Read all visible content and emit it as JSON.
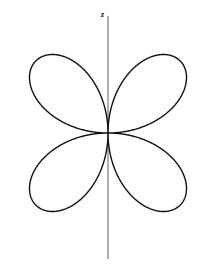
{
  "figure": {
    "name": "four-lobe-polar-pattern",
    "width": 216,
    "height": 267,
    "background_color": "#ffffff"
  },
  "axes": {
    "vertical": {
      "label": "z",
      "label_style": "bold-italic",
      "color": "#6e6e6e",
      "stroke_width": 1.1,
      "x": 108,
      "y_top": 16,
      "y_bottom": 259
    }
  },
  "curve": {
    "name": "four-lobe-rose",
    "color": "#111111",
    "stroke_width": 1.4,
    "fill": "none",
    "origin": {
      "x": 108,
      "y": 133
    },
    "lobe_count": 4,
    "lobe_axis_angles_deg": [
      45,
      135,
      225,
      315
    ],
    "lobe_half_width_deg": 45,
    "lobe_radius_px": 102,
    "lobe_tips_px": [
      {
        "label": "upper-left",
        "x": 22,
        "y": 48
      },
      {
        "label": "upper-right",
        "x": 194,
        "y": 48
      },
      {
        "label": "lower-left",
        "x": 22,
        "y": 218
      },
      {
        "label": "lower-right",
        "x": 194,
        "y": 218
      }
    ]
  },
  "chart_data": {
    "type": "line",
    "plot_style": "polar",
    "title": "",
    "subtitle": "",
    "xlabel": "",
    "ylabel": "z",
    "legend": [],
    "grid": false,
    "annotations": [
      {
        "text": "z",
        "x_px": 105,
        "y_px": 15,
        "role": "axis-label"
      }
    ],
    "theta_deg": [
      0,
      5,
      10,
      15,
      20,
      25,
      30,
      35,
      40,
      45,
      50,
      55,
      60,
      65,
      70,
      75,
      80,
      85,
      90,
      95,
      100,
      105,
      110,
      115,
      120,
      125,
      130,
      135,
      140,
      145,
      150,
      155,
      160,
      165,
      170,
      175,
      180,
      185,
      190,
      195,
      200,
      205,
      210,
      215,
      220,
      225,
      230,
      235,
      240,
      245,
      250,
      255,
      260,
      265,
      270,
      275,
      280,
      285,
      290,
      295,
      300,
      305,
      310,
      315,
      320,
      325,
      330,
      335,
      340,
      345,
      350,
      355,
      360
    ],
    "r_normalized": [
      0.0,
      0.174,
      0.342,
      0.5,
      0.643,
      0.766,
      0.866,
      0.94,
      0.985,
      1.0,
      0.985,
      0.94,
      0.866,
      0.766,
      0.643,
      0.5,
      0.342,
      0.174,
      0.0,
      0.174,
      0.342,
      0.5,
      0.643,
      0.766,
      0.866,
      0.94,
      0.985,
      1.0,
      0.985,
      0.94,
      0.866,
      0.766,
      0.643,
      0.5,
      0.342,
      0.174,
      0.0,
      0.174,
      0.342,
      0.5,
      0.643,
      0.766,
      0.866,
      0.94,
      0.985,
      1.0,
      0.985,
      0.94,
      0.866,
      0.766,
      0.643,
      0.5,
      0.342,
      0.174,
      0.0,
      0.174,
      0.342,
      0.5,
      0.643,
      0.766,
      0.866,
      0.94,
      0.985,
      1.0,
      0.985,
      0.94,
      0.866,
      0.766,
      0.643,
      0.5,
      0.342,
      0.174,
      0.0
    ],
    "r_formula": "r = |sin(2*theta)|",
    "r_max_px": 102,
    "rlim": [
      0,
      1
    ],
    "theta_lim_deg": [
      0,
      360
    ]
  }
}
